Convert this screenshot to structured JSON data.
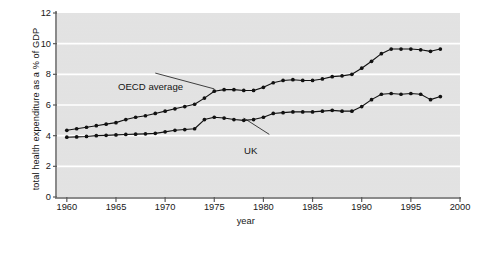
{
  "chart_data": {
    "type": "line",
    "title": "",
    "xlabel": "year",
    "ylabel": "total health expenditure as a % of GDP",
    "xlim": [
      1959,
      2000
    ],
    "ylim": [
      0,
      12
    ],
    "xticks": [
      1960,
      1965,
      1970,
      1975,
      1980,
      1985,
      1990,
      1995,
      2000
    ],
    "yticks": [
      0,
      2,
      4,
      6,
      8,
      10,
      12
    ],
    "grid": "horizontal-white-at-y-2-4-6-8-10",
    "plot_background": "#e3e3e3",
    "legend": "none (inline annotations)",
    "marker": "filled-circle",
    "line_color": "#111111",
    "annotations": [
      {
        "text": "OECD average",
        "x": 1969.0,
        "y": 8.05,
        "points_to_x": 1975.0,
        "points_to_y": 7.05
      },
      {
        "text": "UK",
        "x": 1980.6,
        "y": 4.05,
        "points_to_x": 1978.0,
        "points_to_y": 5.15
      }
    ],
    "series": [
      {
        "name": "OECD average",
        "x": [
          1960,
          1961,
          1962,
          1963,
          1964,
          1965,
          1966,
          1967,
          1968,
          1969,
          1970,
          1971,
          1972,
          1973,
          1974,
          1975,
          1976,
          1977,
          1978,
          1979,
          1980,
          1981,
          1982,
          1983,
          1984,
          1985,
          1986,
          1987,
          1988,
          1989,
          1990,
          1991,
          1992,
          1993,
          1994,
          1995,
          1996,
          1997,
          1998
        ],
        "values": [
          4.35,
          4.45,
          4.55,
          4.65,
          4.75,
          4.85,
          5.05,
          5.2,
          5.3,
          5.45,
          5.6,
          5.75,
          5.9,
          6.05,
          6.45,
          6.9,
          7.0,
          7.0,
          6.95,
          6.95,
          7.15,
          7.45,
          7.6,
          7.65,
          7.6,
          7.6,
          7.7,
          7.85,
          7.9,
          8.0,
          8.4,
          8.85,
          9.35,
          9.65,
          9.65,
          9.65,
          9.6,
          9.5,
          9.65
        ]
      },
      {
        "name": "UK",
        "x": [
          1960,
          1961,
          1962,
          1963,
          1964,
          1965,
          1966,
          1967,
          1968,
          1969,
          1970,
          1971,
          1972,
          1973,
          1974,
          1975,
          1976,
          1977,
          1978,
          1979,
          1980,
          1981,
          1982,
          1983,
          1984,
          1985,
          1986,
          1987,
          1988,
          1989,
          1990,
          1991,
          1992,
          1993,
          1994,
          1995,
          1996,
          1997,
          1998
        ],
        "values": [
          3.9,
          3.92,
          3.95,
          4.0,
          4.02,
          4.05,
          4.08,
          4.1,
          4.12,
          4.15,
          4.25,
          4.35,
          4.4,
          4.45,
          5.05,
          5.2,
          5.15,
          5.05,
          5.0,
          5.05,
          5.2,
          5.45,
          5.5,
          5.55,
          5.55,
          5.55,
          5.6,
          5.65,
          5.6,
          5.6,
          5.9,
          6.35,
          6.7,
          6.75,
          6.7,
          6.75,
          6.7,
          6.35,
          6.55
        ]
      }
    ]
  }
}
